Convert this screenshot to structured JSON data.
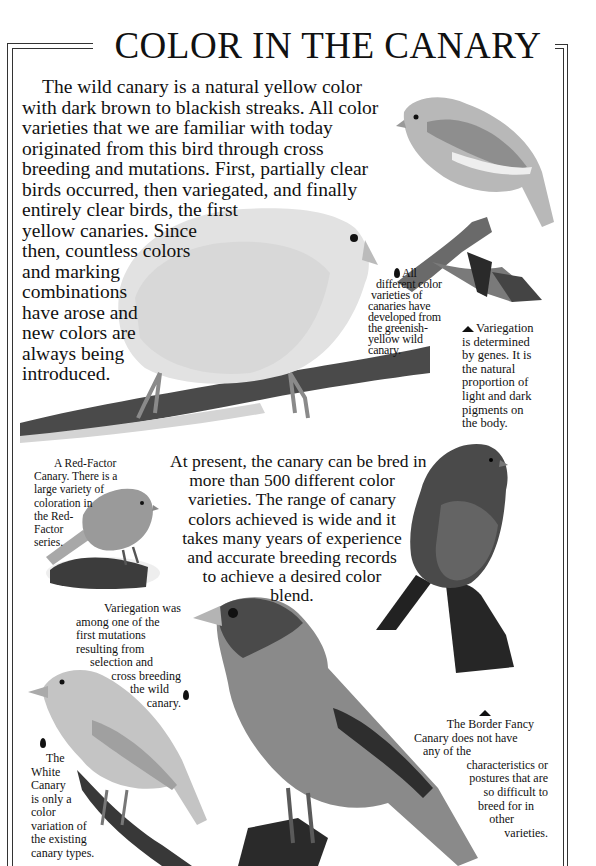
{
  "page": {
    "title": "COLOR IN THE CANARY",
    "palette": {
      "ink": "#111111",
      "frame": "#333333",
      "paper": "#ffffff"
    }
  },
  "intro": {
    "lines": [
      "The wild canary is a natural yellow color",
      "with dark brown to blackish streaks. All color",
      "varieties that we are familiar with today",
      "originated from this bird through cross",
      "breeding and mutations. First, partially clear",
      "birds occurred, then variegated, and finally",
      "entirely clear birds, the first",
      "yellow canaries. Since",
      "then, countless colors",
      "and marking",
      "combinations",
      "have arose and",
      "new colors are",
      "always being",
      "introduced."
    ]
  },
  "middle_text": {
    "lines": [
      "At present, the canary can be bred in",
      "more than 500 different color",
      "varieties. The range of canary",
      "colors achieved is wide and it",
      "takes many years of experience",
      "and accurate breeding records",
      "to achieve a desired color",
      "blend."
    ]
  },
  "captions": {
    "all_varieties": {
      "bullet": "leaf-bullet-left",
      "lines": [
        "All",
        "different color",
        "varieties of",
        "canaries have",
        "developed from",
        "the greenish-",
        "yellow wild",
        "canary."
      ]
    },
    "variegation_genes": {
      "bullet": "leaf-bullet-up",
      "lines": [
        "Variegation",
        "is determined",
        "by genes. It is",
        "the natural",
        "proportion of",
        "light and dark",
        "pigments on",
        "the body."
      ]
    },
    "red_factor": {
      "lines": [
        "A Red-Factor",
        "Canary. There is a",
        "large variety of",
        "coloration in",
        "the Red-",
        "Factor",
        "series."
      ]
    },
    "variegation_mutation": {
      "bullet": "leaf-bullet-right",
      "lines": [
        "Variegation was",
        "among one of the",
        "first mutations",
        "resulting from",
        "selection and",
        "cross breeding",
        "the wild",
        "canary."
      ]
    },
    "white_canary": {
      "bullet": "leaf-bullet-down",
      "lines": [
        "The",
        "White",
        "Canary",
        "is only a",
        "color",
        "variation of",
        "the existing",
        "canary types."
      ]
    },
    "border_fancy": {
      "bullet": "leaf-bullet-up",
      "lines": [
        "The Border Fancy",
        "Canary does not have",
        "any of the",
        "characteristics or",
        "postures that are",
        "so difficult to",
        "breed for in",
        "other",
        "varieties."
      ]
    }
  },
  "photos": [
    {
      "name": "variegated-canary-on-branch"
    },
    {
      "name": "clear-yellow-canary-on-branch"
    },
    {
      "name": "red-factor-canary-on-rock"
    },
    {
      "name": "dark-canary-on-rock"
    },
    {
      "name": "variegated-canary-large"
    },
    {
      "name": "white-canary-on-branch"
    }
  ]
}
